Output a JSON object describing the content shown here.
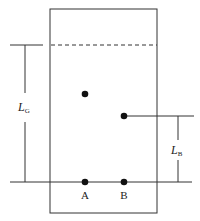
{
  "diagram": {
    "labels": {
      "lg_main": "L",
      "lg_sub": "G",
      "lb_main": "L",
      "lb_sub": "B",
      "point_a": "A",
      "point_b": "B"
    },
    "colors": {
      "stroke": "#222222",
      "background": "#ffffff"
    }
  }
}
